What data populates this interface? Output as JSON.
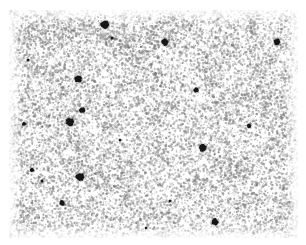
{
  "image": {
    "kind": "speckle-micrograph",
    "title": "Grayscale speckle field with dark inclusions",
    "canvas": {
      "width": 306,
      "height": 245
    },
    "plate": {
      "x": 9,
      "y": 10,
      "width": 289,
      "height": 228
    },
    "background_color": "#ffffff",
    "speckle_color": "#8f8f8f",
    "speckle_dark_color": "#6e6e6e",
    "blob_color": "#161616",
    "blob_halo_color": "#585858",
    "noise": {
      "seed": 20240517,
      "dot_count": 14200,
      "dot_min_radius": 0.45,
      "dot_max_radius": 1.35,
      "min_opacity": 0.12,
      "max_opacity": 0.72,
      "clump_count": 190,
      "clump_radius": 13,
      "clump_dots": 26,
      "edge_fade_px": 14
    },
    "blobs": [
      {
        "id": "blob-01",
        "cx": 105,
        "cy": 25,
        "r": 4.2,
        "halo": 6.2
      },
      {
        "id": "blob-02",
        "cx": 165,
        "cy": 42,
        "r": 3.4,
        "halo": 5.0
      },
      {
        "id": "blob-03",
        "cx": 277,
        "cy": 42,
        "r": 3.3,
        "halo": 4.8
      },
      {
        "id": "blob-04",
        "cx": 112,
        "cy": 38,
        "r": 1.5,
        "halo": 2.6
      },
      {
        "id": "blob-05",
        "cx": 78,
        "cy": 79,
        "r": 3.6,
        "halo": 5.4
      },
      {
        "id": "blob-06",
        "cx": 196,
        "cy": 90,
        "r": 2.4,
        "halo": 3.8
      },
      {
        "id": "blob-07",
        "cx": 82,
        "cy": 110,
        "r": 2.9,
        "halo": 4.4
      },
      {
        "id": "blob-08",
        "cx": 70,
        "cy": 122,
        "r": 4.0,
        "halo": 6.0
      },
      {
        "id": "blob-09",
        "cx": 24,
        "cy": 124,
        "r": 2.0,
        "halo": 3.2
      },
      {
        "id": "blob-10",
        "cx": 249,
        "cy": 126,
        "r": 2.2,
        "halo": 3.6
      },
      {
        "id": "blob-11",
        "cx": 120,
        "cy": 140,
        "r": 1.3,
        "halo": 2.3
      },
      {
        "id": "blob-12",
        "cx": 203,
        "cy": 148,
        "r": 3.8,
        "halo": 5.6
      },
      {
        "id": "blob-13",
        "cx": 32,
        "cy": 170,
        "r": 2.1,
        "halo": 3.4
      },
      {
        "id": "blob-14",
        "cx": 80,
        "cy": 177,
        "r": 4.1,
        "halo": 6.1
      },
      {
        "id": "blob-15",
        "cx": 42,
        "cy": 181,
        "r": 1.4,
        "halo": 2.4
      },
      {
        "id": "blob-16",
        "cx": 62,
        "cy": 203,
        "r": 2.6,
        "halo": 4.0
      },
      {
        "id": "blob-17",
        "cx": 170,
        "cy": 201,
        "r": 1.3,
        "halo": 2.2
      },
      {
        "id": "blob-18",
        "cx": 215,
        "cy": 222,
        "r": 3.5,
        "halo": 5.2
      },
      {
        "id": "blob-19",
        "cx": 146,
        "cy": 228,
        "r": 1.2,
        "halo": 2.1
      },
      {
        "id": "blob-20",
        "cx": 28,
        "cy": 60,
        "r": 1.2,
        "halo": 2.1
      }
    ]
  }
}
